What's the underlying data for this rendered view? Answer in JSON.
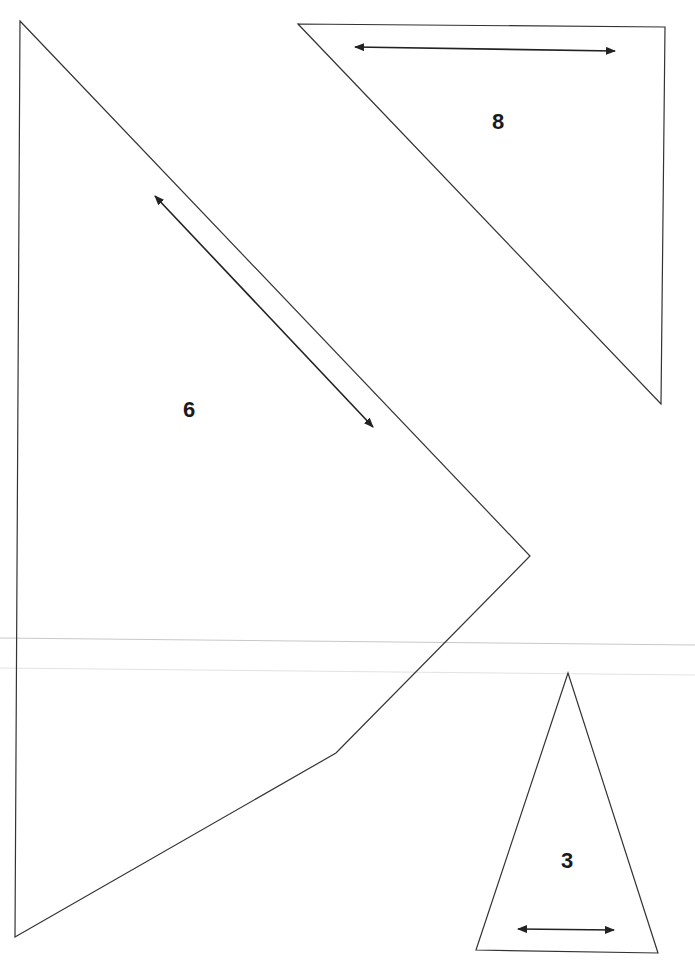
{
  "diagram": {
    "type": "pattern-pieces",
    "background": "#ffffff",
    "stroke_color": "#333333",
    "pieces": [
      {
        "label": "6",
        "shape": "polygon",
        "vertices": [
          [
            20,
            21
          ],
          [
            530,
            556
          ],
          [
            336,
            753
          ],
          [
            15,
            937
          ]
        ],
        "label_position": [
          189,
          410
        ],
        "grain_arrow": {
          "from": [
            155,
            196
          ],
          "to": [
            373,
            427
          ],
          "direction": "double-headed"
        }
      },
      {
        "label": "8",
        "shape": "triangle",
        "vertices": [
          [
            298,
            24
          ],
          [
            665,
            27
          ],
          [
            661,
            404
          ]
        ],
        "label_position": [
          498,
          122
        ],
        "grain_arrow": {
          "from": [
            355,
            47
          ],
          "to": [
            615,
            51
          ],
          "direction": "double-headed"
        }
      },
      {
        "label": "3",
        "shape": "triangle",
        "vertices": [
          [
            568,
            673
          ],
          [
            476,
            950
          ],
          [
            658,
            953
          ]
        ],
        "label_position": [
          567,
          861
        ],
        "grain_arrow": {
          "from": [
            518,
            929
          ],
          "to": [
            614,
            930
          ],
          "direction": "double-headed"
        }
      }
    ],
    "guide_lines": [
      {
        "from": [
          0,
          638
        ],
        "to": [
          695,
          645
        ],
        "shade": "#c8c8c8"
      },
      {
        "from": [
          0,
          668
        ],
        "to": [
          695,
          675
        ],
        "shade": "#e2e2e2"
      }
    ]
  }
}
